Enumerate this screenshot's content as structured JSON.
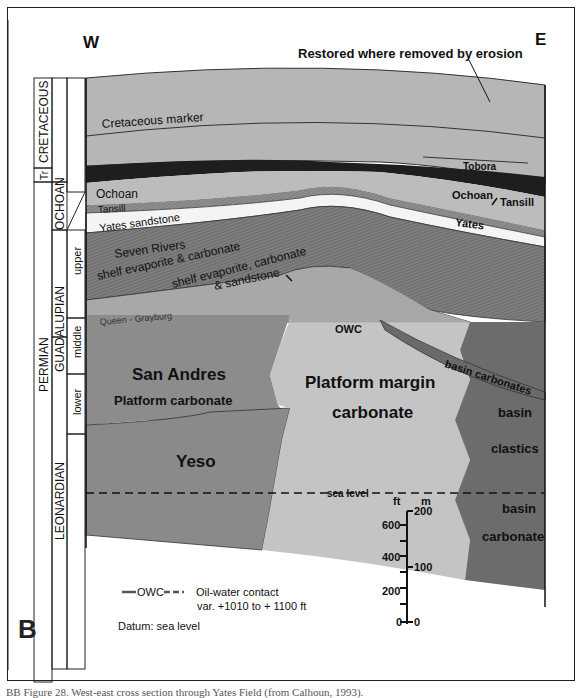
{
  "figure": {
    "panel_label": "B",
    "direction_west": "W",
    "direction_east": "E",
    "erosion_note": "Restored where removed by erosion",
    "caption": "BB Figure 28. West-east cross section through Yates Field (from Calhoun, 1993)."
  },
  "stratigraphic_column": {
    "systems": [
      "CRETACEOUS",
      "Tr",
      "PERMIAN"
    ],
    "series": [
      "OCHOAN",
      "GUADALUPIAN",
      "LEONARDIAN"
    ],
    "subdivisions": [
      "upper",
      "middle",
      "lower"
    ]
  },
  "units": {
    "cretaceous_marker": "Cretaceous marker",
    "tobora": "Tobora",
    "ochoan_west": "Ochoan",
    "ochoan_east": "Ochoan",
    "tansill_west": "Tansill",
    "tansill_east": "Tansill",
    "yates_west": "Yates sandstone",
    "yates_east": "Yates",
    "seven_rivers_1": "Seven Rivers",
    "seven_rivers_2": "shelf evaporite & carbonate",
    "shelf_sand_1": "shelf evaporite, carbonate",
    "shelf_sand_2": "& sandstone",
    "queen_grayburg": "Queen - Grayburg",
    "owc": "OWC",
    "san_andres": "San Andres",
    "platform_carbonate": "Platform carbonate",
    "platform_margin_1": "Platform margin",
    "platform_margin_2": "carbonate",
    "basin_carbonates": "basin carbonates",
    "basin_clastics_1": "basin",
    "basin_clastics_2": "clastics",
    "basin_carbonate_1": "basin",
    "basin_carbonate_2": "carbonate",
    "yeso": "Yeso",
    "sea_level": "sea level"
  },
  "scale": {
    "ft_label": "ft",
    "m_label": "m",
    "ft_ticks": [
      "600",
      "400",
      "200",
      "0"
    ],
    "m_ticks": [
      "200",
      "100",
      "0"
    ]
  },
  "legend": {
    "owc_symbol": "OWC",
    "owc_desc": "Oil-water contact",
    "owc_range": "var. +1010 to + 1100 ft",
    "datum": "Datum: sea level"
  },
  "colors": {
    "upper_gray": "#b4b4b4",
    "dark_band": "#1e1e1e",
    "hatched": "#7a7a7a",
    "yates": "#f4f4f4",
    "san_andres": "#8a8a8a",
    "platform_margin": "#c4c4c4",
    "oil_zone": "#a8a8a8",
    "basin": "#6a6a6a"
  }
}
